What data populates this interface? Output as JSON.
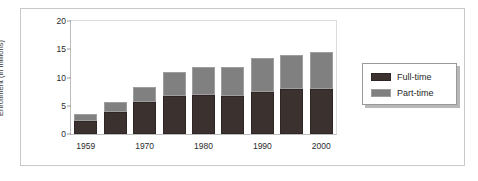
{
  "chart_data": {
    "type": "bar",
    "subtype": "stacked-bar",
    "title": "",
    "xlabel": "",
    "ylabel": "Enrollment (in millions)",
    "ylim": [
      0,
      20
    ],
    "yticks": [
      0,
      5,
      10,
      15,
      20
    ],
    "ytick_labels": [
      "0",
      "5",
      "10",
      "15",
      "20"
    ],
    "grid": false,
    "legend_position": "right",
    "categories": [
      "1959",
      "",
      "1970",
      "",
      "1980",
      "",
      "1990",
      "",
      "2000"
    ],
    "visible_xtick_labels": [
      "1959",
      "1970",
      "1980",
      "1990",
      "2000"
    ],
    "series": [
      {
        "name": "Full-time",
        "color": "#3b3230",
        "values": [
          2.3,
          3.9,
          5.6,
          6.7,
          6.9,
          6.7,
          7.5,
          7.9,
          8.0
        ]
      },
      {
        "name": "Part-time",
        "color": "#808080",
        "values": [
          1.3,
          1.8,
          2.8,
          4.3,
          5.0,
          5.2,
          6.0,
          6.1,
          6.5
        ]
      }
    ],
    "totals": [
      3.6,
      5.7,
      8.4,
      11.0,
      11.9,
      11.9,
      13.5,
      14.0,
      14.5
    ]
  },
  "legend": {
    "items": [
      {
        "label": "Full-time",
        "swatch": "dark-swatch"
      },
      {
        "label": "Part-time",
        "swatch": "gray-swatch"
      }
    ]
  }
}
